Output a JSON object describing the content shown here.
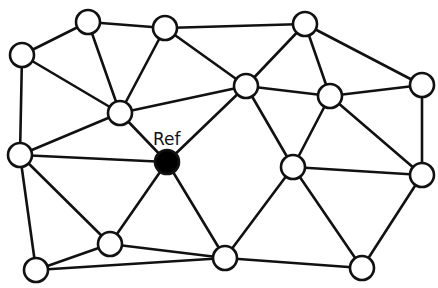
{
  "diagram": {
    "type": "network-graph",
    "node_radius": 12,
    "colors": {
      "edge": "#111111",
      "node_fill": "#ffffff",
      "ref_fill": "#000000"
    },
    "reference_label": "Ref",
    "nodes": [
      {
        "id": "A",
        "x": 88,
        "y": 22
      },
      {
        "id": "B",
        "x": 165,
        "y": 28
      },
      {
        "id": "C",
        "x": 305,
        "y": 24
      },
      {
        "id": "D",
        "x": 22,
        "y": 55
      },
      {
        "id": "E",
        "x": 120,
        "y": 113
      },
      {
        "id": "F",
        "x": 246,
        "y": 86
      },
      {
        "id": "G",
        "x": 330,
        "y": 96
      },
      {
        "id": "H",
        "x": 422,
        "y": 85
      },
      {
        "id": "Ref",
        "x": 167,
        "y": 162,
        "ref": true
      },
      {
        "id": "I",
        "x": 20,
        "y": 155
      },
      {
        "id": "J",
        "x": 293,
        "y": 167
      },
      {
        "id": "K",
        "x": 422,
        "y": 175
      },
      {
        "id": "L",
        "x": 110,
        "y": 244
      },
      {
        "id": "M",
        "x": 36,
        "y": 270
      },
      {
        "id": "N",
        "x": 225,
        "y": 258
      },
      {
        "id": "O",
        "x": 362,
        "y": 268
      }
    ],
    "edges": [
      [
        "D",
        "A"
      ],
      [
        "A",
        "B"
      ],
      [
        "B",
        "C"
      ],
      [
        "A",
        "E"
      ],
      [
        "B",
        "E"
      ],
      [
        "D",
        "E"
      ],
      [
        "D",
        "I"
      ],
      [
        "E",
        "I"
      ],
      [
        "E",
        "Ref"
      ],
      [
        "E",
        "F"
      ],
      [
        "B",
        "F"
      ],
      [
        "C",
        "F"
      ],
      [
        "C",
        "G"
      ],
      [
        "C",
        "H"
      ],
      [
        "F",
        "G"
      ],
      [
        "G",
        "H"
      ],
      [
        "F",
        "Ref"
      ],
      [
        "F",
        "J"
      ],
      [
        "G",
        "J"
      ],
      [
        "G",
        "K"
      ],
      [
        "H",
        "K"
      ],
      [
        "J",
        "K"
      ],
      [
        "J",
        "N"
      ],
      [
        "J",
        "O"
      ],
      [
        "K",
        "O"
      ],
      [
        "I",
        "Ref"
      ],
      [
        "I",
        "L"
      ],
      [
        "I",
        "M"
      ],
      [
        "Ref",
        "L"
      ],
      [
        "Ref",
        "N"
      ],
      [
        "L",
        "M"
      ],
      [
        "L",
        "N"
      ],
      [
        "M",
        "N"
      ],
      [
        "N",
        "O"
      ]
    ]
  }
}
